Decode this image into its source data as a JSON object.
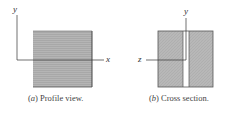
{
  "figure_a": {
    "caption_letter": "a",
    "caption_text": "Profile view.",
    "axis_x_label": "x",
    "axis_y_label": "y"
  },
  "figure_b": {
    "caption_letter": "b",
    "caption_text": "Cross section.",
    "axis_y_label": "y",
    "axis_z_label": "z"
  },
  "colors": {
    "wood": "#b8b8b8",
    "edge": "#555555",
    "axis": "#333333"
  }
}
